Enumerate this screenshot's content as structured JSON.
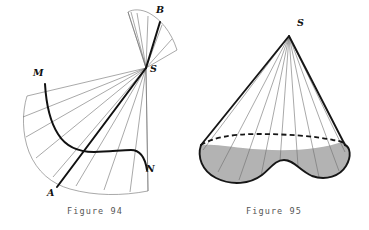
{
  "page": {
    "width": 369,
    "height": 230,
    "background": "#ffffff"
  },
  "colors": {
    "ink": "#111111",
    "thin_line": "#6f6f6f",
    "base_fill": "#b3b3b3",
    "caption_text": "#555555",
    "hidden_edge": "#161616"
  },
  "figures": [
    {
      "id": "figure-94",
      "caption": "Figure 94",
      "description": "Developed (unrolled) oblique cone surface with apex S, sector bounded by generators SA and SB, and curved directrix arc M to N.",
      "apex_label": "S",
      "labels": [
        {
          "name": "B",
          "text": "B",
          "x": 156,
          "y": 13
        },
        {
          "name": "S",
          "text": "S",
          "x": 150,
          "y": 72
        },
        {
          "name": "M",
          "text": "M",
          "x": 33,
          "y": 76
        },
        {
          "name": "N",
          "text": "N",
          "x": 146,
          "y": 172
        },
        {
          "name": "A",
          "text": "A",
          "x": 47,
          "y": 196
        }
      ],
      "generator_count": 13
    },
    {
      "id": "figure-95",
      "caption": "Figure 95",
      "description": "Oblique cone with apex S standing on a shaded kidney-shaped base; the far half of the base outline is drawn dashed as a hidden edge.",
      "apex_label": "S",
      "labels": [
        {
          "name": "S",
          "text": "S",
          "x": 124,
          "y": 22
        }
      ],
      "generator_count": 9,
      "base_fill": "#b3b3b3"
    }
  ]
}
